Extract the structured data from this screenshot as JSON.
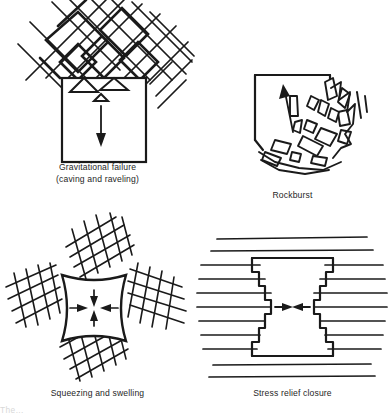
{
  "figure": {
    "background_color": "#ffffff",
    "ink_color": "#1a1a1a",
    "panel_count": 4
  },
  "panels": {
    "gravitational": {
      "caption_line1": "Gravitational failure",
      "caption_line2": "(caving and raveling)",
      "opening_shape": "square",
      "rock_structure": "two intersecting joint sets at about plus and minus 45 degrees forming rhombic blocks",
      "arrow_direction": "down",
      "arrow_label": "falling block movement",
      "loose_block_count": 3
    },
    "rockburst": {
      "caption_line1": "Rockburst",
      "caption_line2": "",
      "opening_shape": "square",
      "rock_structure": "angular slab fragments ejected from right wall and floor",
      "arrow_direction": "up-left",
      "arrow_label": "violent ejection of rock fragments",
      "fragment_count": 16
    },
    "squeezing": {
      "caption_line1": "Squeezing and swelling",
      "caption_line2": "",
      "opening_shape": "square with inward bulging sides",
      "rock_structure": "four cross-hatched fractured rock masses above, below, left and right",
      "arrow_direction": "inward from all four sides",
      "arrow_label": "plastic inward deformation",
      "arrow_count": 4
    },
    "stress_relief": {
      "caption_line1": "Stress relief closure",
      "caption_line2": "",
      "opening_shape": "square with stepped side walls",
      "rock_structure": "horizontal bedded strata with stepped wall closure, maximum at mid height",
      "arrow_direction": "inward from left and right",
      "arrow_label": "horizontal wall closure",
      "arrow_count": 2
    }
  },
  "bottom_artifact": {
    "text": "The..."
  }
}
